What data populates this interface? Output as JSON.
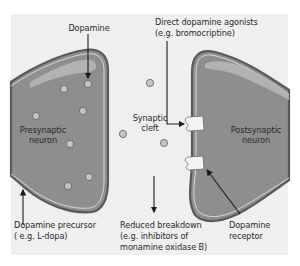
{
  "figure": {
    "colors": {
      "background": "#efefef",
      "neuron_fill": "#8e8e8e",
      "neuron_highlight": "#b9b9b9",
      "membrane": "#5a5a5a",
      "vesicle_fill": "#c4c4c4",
      "receptor_fill": "#f4f4f4",
      "arrow": "#1a1a1a",
      "text": "#2a2a2a"
    }
  },
  "labels": {
    "dopamine": "Dopamine",
    "agonists_line1": "Direct dopamine agonists",
    "agonists_line2": "(e.g. bromocriptine)",
    "synaptic_line1": "Synaptic",
    "synaptic_line2": "cleft",
    "presynaptic_line1": "Presynaptic",
    "presynaptic_line2": "neuron",
    "postsynaptic_line1": "Postsynaptic",
    "postsynaptic_line2": "neuron",
    "precursor_line1": "Dopamine precursor",
    "precursor_line2": "( e.g. L-dopa)",
    "breakdown_line1": "Reduced breakdown",
    "breakdown_line2": "(e.g. inhibitors of",
    "breakdown_line3": "monamine oxidase B)",
    "receptor_line1": "Dopamine",
    "receptor_line2": "receptor"
  },
  "nodes": [
    {
      "id": "presynaptic-neuron",
      "label": "Presynaptic neuron"
    },
    {
      "id": "postsynaptic-neuron",
      "label": "Postsynaptic neuron"
    },
    {
      "id": "synaptic-cleft",
      "label": "Synaptic cleft"
    },
    {
      "id": "dopamine-receptor-upper",
      "label": "Dopamine receptor"
    },
    {
      "id": "dopamine-receptor-lower",
      "label": "Dopamine receptor"
    }
  ],
  "edges": [
    {
      "from": "Dopamine",
      "to": "vesicle",
      "type": "arrow"
    },
    {
      "from": "Direct dopamine agonists",
      "to": "dopamine-receptor-upper",
      "type": "elbow-arrow"
    },
    {
      "from": "Dopamine precursor",
      "to": "presynaptic-neuron",
      "type": "arrow"
    },
    {
      "from": "Reduced breakdown",
      "to": "synaptic-cleft",
      "type": "arrow"
    },
    {
      "from": "Dopamine receptor label",
      "to": "dopamine-receptor-lower",
      "type": "arrow"
    }
  ]
}
